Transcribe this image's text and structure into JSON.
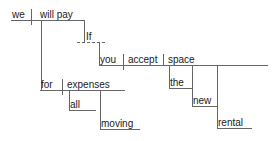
{
  "diagram": {
    "kind": "reed-kellogg-sentence-diagram",
    "sentence": "We will pay for all moving expenses if you accept the new rental space.",
    "stroke_color": "#666666",
    "text_color": "#1a1a1a",
    "background_color": "#ffffff",
    "nodes": [
      {
        "id": "subject",
        "label": "we",
        "role": "subject",
        "x": 12,
        "y": 9,
        "baseline_y": 20
      },
      {
        "id": "predicate",
        "label": "will pay",
        "role": "verb",
        "x": 40,
        "y": 9,
        "baseline_y": 20
      },
      {
        "id": "prep_for",
        "label": "for",
        "role": "preposition",
        "x": 41,
        "y": 79,
        "baseline_y": 90
      },
      {
        "id": "obj_expenses",
        "label": "expenses",
        "role": "object-of-preposition",
        "x": 67,
        "y": 79,
        "baseline_y": 90
      },
      {
        "id": "mod_all",
        "label": "all",
        "role": "modifier",
        "x": 70,
        "y": 99,
        "baseline_y": 110
      },
      {
        "id": "mod_moving",
        "label": "moving",
        "role": "modifier",
        "x": 101,
        "y": 118,
        "baseline_y": 129
      },
      {
        "id": "conj_if",
        "label": "If",
        "role": "subordinating-conjunction",
        "x": 86,
        "y": 31,
        "baseline_y": 42
      },
      {
        "id": "sub_subject",
        "label": "you",
        "role": "subject",
        "x": 100,
        "y": 54,
        "baseline_y": 65
      },
      {
        "id": "sub_verb",
        "label": "accept",
        "role": "verb",
        "x": 128,
        "y": 54,
        "baseline_y": 65
      },
      {
        "id": "sub_object",
        "label": "space",
        "role": "direct-object",
        "x": 168,
        "y": 54,
        "baseline_y": 65
      },
      {
        "id": "mod_the",
        "label": "the",
        "role": "modifier",
        "x": 170,
        "y": 77,
        "baseline_y": 88
      },
      {
        "id": "mod_new",
        "label": "new",
        "role": "modifier",
        "x": 193,
        "y": 95,
        "baseline_y": 106
      },
      {
        "id": "mod_rental",
        "label": "rental",
        "role": "modifier",
        "x": 218,
        "y": 117,
        "baseline_y": 128
      }
    ],
    "lines": {
      "main_baseline": {
        "x1": 11,
        "y1": 20,
        "x2": 84,
        "y2": 20,
        "style": "solid"
      },
      "subject_divider": {
        "x1": 31,
        "y1": 9,
        "x2": 31,
        "y2": 25,
        "style": "solid"
      },
      "verb_to_prep": {
        "x1": 41,
        "y1": 20,
        "x2": 41,
        "y2": 90,
        "style": "solid"
      },
      "verb_to_if": {
        "x1": 84,
        "y1": 20,
        "x2": 84,
        "y2": 42,
        "style": "solid"
      },
      "if_dashed": {
        "x1": 77,
        "y1": 42,
        "x2": 107,
        "y2": 42,
        "style": "dashed"
      },
      "if_to_clause": {
        "x1": 99,
        "y1": 42,
        "x2": 99,
        "y2": 65,
        "style": "solid"
      },
      "sub_baseline": {
        "x1": 99,
        "y1": 65,
        "x2": 268,
        "y2": 65,
        "style": "solid"
      },
      "sub_subject_divider": {
        "x1": 123,
        "y1": 54,
        "x2": 123,
        "y2": 70,
        "style": "solid"
      },
      "sub_verb_divider": {
        "x1": 163,
        "y1": 54,
        "x2": 163,
        "y2": 65,
        "style": "solid"
      },
      "prep_baseline": {
        "x1": 40,
        "y1": 90,
        "x2": 125,
        "y2": 90,
        "style": "solid"
      },
      "prep_divider": {
        "x1": 62,
        "y1": 79,
        "x2": 62,
        "y2": 95,
        "style": "solid"
      },
      "expenses_to_all": {
        "x1": 69,
        "y1": 90,
        "x2": 69,
        "y2": 110,
        "style": "solid"
      },
      "all_baseline": {
        "x1": 69,
        "y1": 110,
        "x2": 96,
        "y2": 110,
        "style": "solid"
      },
      "expenses_to_moving": {
        "x1": 100,
        "y1": 90,
        "x2": 100,
        "y2": 129,
        "style": "solid"
      },
      "moving_baseline": {
        "x1": 100,
        "y1": 129,
        "x2": 140,
        "y2": 129,
        "style": "solid"
      },
      "space_to_the": {
        "x1": 169,
        "y1": 65,
        "x2": 169,
        "y2": 88,
        "style": "solid"
      },
      "the_baseline": {
        "x1": 169,
        "y1": 88,
        "x2": 192,
        "y2": 88,
        "style": "solid"
      },
      "space_to_new": {
        "x1": 192,
        "y1": 65,
        "x2": 192,
        "y2": 106,
        "style": "solid"
      },
      "new_baseline": {
        "x1": 192,
        "y1": 106,
        "x2": 217,
        "y2": 106,
        "style": "solid"
      },
      "space_to_rental": {
        "x1": 217,
        "y1": 65,
        "x2": 217,
        "y2": 128,
        "style": "solid"
      },
      "rental_baseline": {
        "x1": 217,
        "y1": 128,
        "x2": 252,
        "y2": 128,
        "style": "solid"
      }
    }
  }
}
